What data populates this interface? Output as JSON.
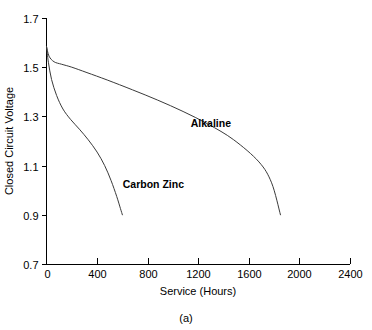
{
  "chart_data": {
    "type": "line",
    "title": "",
    "caption": "(a)",
    "xlabel": "Service (Hours)",
    "ylabel": "Closed Circuit Voltage",
    "xlim": [
      0,
      2400
    ],
    "ylim": [
      0.7,
      1.7
    ],
    "xticks": [
      0,
      400,
      800,
      1200,
      1600,
      2000,
      2400
    ],
    "xtick_labels": [
      "0",
      "400",
      "800",
      "1200",
      "1600",
      "2000",
      "2400"
    ],
    "yticks": [
      0.7,
      0.9,
      1.1,
      1.3,
      1.5,
      1.7
    ],
    "ytick_labels": [
      "0.7",
      "0.9",
      "1.1",
      "1.3",
      "1.5",
      "1.7"
    ],
    "grid": false,
    "legend_position": "inline-annotations",
    "series": [
      {
        "name": "Alkaline",
        "label": "Alkaline",
        "color": "#3a3a3a",
        "label_x": 1300,
        "label_y": 1.255,
        "x": [
          0,
          20,
          60,
          120,
          200,
          320,
          480,
          680,
          880,
          1080,
          1280,
          1480,
          1680,
          1780,
          1850
        ],
        "y": [
          1.585,
          1.545,
          1.522,
          1.512,
          1.5,
          1.478,
          1.448,
          1.408,
          1.366,
          1.32,
          1.268,
          1.205,
          1.115,
          1.03,
          0.9
        ]
      },
      {
        "name": "Carbon Zinc",
        "label": "Carbon Zinc",
        "color": "#3a3a3a",
        "label_x": 845,
        "label_y": 1.01,
        "x": [
          0,
          15,
          40,
          80,
          130,
          190,
          260,
          330,
          400,
          460,
          510,
          555,
          585,
          600
        ],
        "y": [
          1.585,
          1.52,
          1.45,
          1.385,
          1.33,
          1.288,
          1.248,
          1.205,
          1.155,
          1.1,
          1.04,
          0.975,
          0.925,
          0.9
        ]
      }
    ]
  }
}
